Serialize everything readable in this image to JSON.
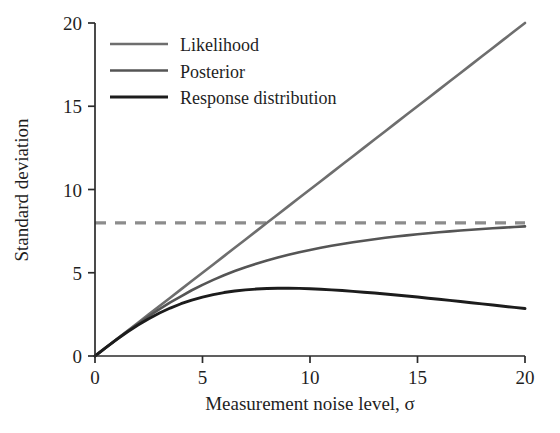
{
  "chart_data": {
    "type": "line",
    "title": "",
    "xlabel": "Measurement noise level, σ",
    "ylabel": "Standard deviation",
    "xlim": [
      0,
      20
    ],
    "ylim": [
      0,
      20
    ],
    "xticks": [
      "0",
      "5",
      "10",
      "15",
      "20"
    ],
    "xtick_values": [
      0,
      5,
      10,
      15,
      20
    ],
    "yticks": [
      "0",
      "5",
      "10",
      "15",
      "20"
    ],
    "ytick_values": [
      0,
      5,
      10,
      15,
      20
    ],
    "grid": false,
    "legend_position": "top-left-inside",
    "x": [
      0,
      0.5,
      1,
      1.5,
      2,
      2.5,
      3,
      3.5,
      4,
      4.5,
      5,
      5.5,
      6,
      6.5,
      7,
      7.5,
      8,
      8.5,
      9,
      9.5,
      10,
      10.5,
      11,
      11.5,
      12,
      12.5,
      13,
      13.5,
      14,
      14.5,
      15,
      15.5,
      16,
      16.5,
      17,
      17.5,
      18,
      18.5,
      19,
      19.5,
      20
    ],
    "series": [
      {
        "name": "Likelihood",
        "color": "#6e6e6e",
        "width": 2.6,
        "dash": "none",
        "values": [
          0,
          0.5,
          1,
          1.5,
          2,
          2.5,
          3,
          3.5,
          4,
          4.5,
          5,
          5.5,
          6,
          6.5,
          7,
          7.5,
          8,
          8.5,
          9,
          9.5,
          10,
          10.5,
          11,
          11.5,
          12,
          12.5,
          13,
          13.5,
          14,
          14.5,
          15,
          15.5,
          16,
          16.5,
          17,
          17.5,
          18,
          18.5,
          19,
          19.5,
          20
        ]
      },
      {
        "name": "Posterior",
        "color": "#555555",
        "width": 2.6,
        "dash": "none",
        "values": [
          0,
          0.499,
          0.992,
          1.473,
          1.94,
          2.388,
          2.814,
          3.217,
          3.578,
          3.949,
          4.275,
          4.575,
          4.85,
          5.1,
          5.331,
          5.542,
          5.738,
          5.915,
          6.08,
          6.232,
          6.372,
          6.5,
          6.62,
          6.73,
          6.833,
          6.927,
          7.015,
          7.097,
          7.173,
          7.244,
          7.31,
          7.372,
          7.43,
          7.484,
          7.535,
          7.583,
          7.628,
          7.67,
          7.71,
          7.748,
          7.783
        ]
      },
      {
        "name": "Response distribution",
        "color": "#1c1c1c",
        "width": 2.9,
        "dash": "none",
        "values": [
          0,
          0.5,
          0.98,
          1.44,
          1.86,
          2.24,
          2.58,
          2.88,
          3.14,
          3.36,
          3.54,
          3.69,
          3.81,
          3.9,
          3.97,
          4.02,
          4.05,
          4.07,
          4.07,
          4.06,
          4.04,
          4.01,
          3.97,
          3.93,
          3.88,
          3.83,
          3.78,
          3.72,
          3.66,
          3.6,
          3.54,
          3.47,
          3.41,
          3.34,
          3.27,
          3.2,
          3.13,
          3.06,
          2.99,
          2.92,
          2.85
        ]
      }
    ],
    "reference_lines": [
      {
        "name": "prior-sd",
        "orientation": "horizontal",
        "value": 8,
        "color": "#8c8c8c",
        "width": 3.2,
        "dash": "dashed",
        "label": ""
      }
    ],
    "legend": [
      {
        "label": "Likelihood",
        "color": "#6e6e6e",
        "width": 2.6
      },
      {
        "label": "Posterior",
        "color": "#555555",
        "width": 2.6
      },
      {
        "label": "Response distribution",
        "color": "#1c1c1c",
        "width": 2.9
      }
    ]
  }
}
